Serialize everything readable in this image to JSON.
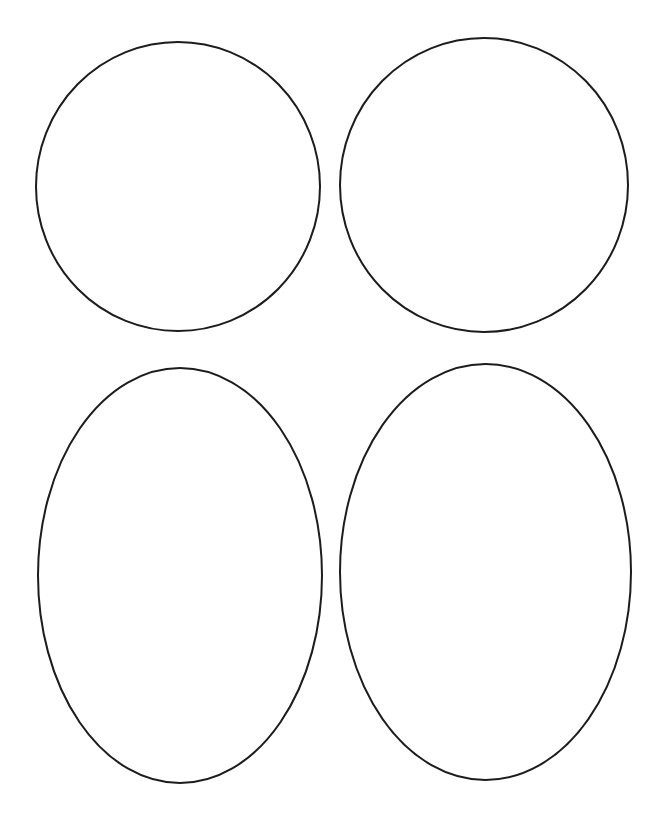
{
  "page": {
    "background_color": "#ffffff",
    "width": 667,
    "height": 825
  },
  "style": {
    "stroke_color": "#1c1c1c",
    "fill_color": "#ffffff",
    "stroke_width": 2
  },
  "shapes": [
    {
      "id": "shape-top-left",
      "name": "circle-top-left",
      "kind": "circle",
      "cx": 178,
      "cy": 186.5,
      "rx": 142,
      "ry": 144.5,
      "bounds": {
        "left": 36,
        "top": 42,
        "right": 320,
        "bottom": 331
      }
    },
    {
      "id": "shape-top-right",
      "name": "circle-top-right",
      "kind": "circle",
      "cx": 484,
      "cy": 185,
      "rx": 144,
      "ry": 147,
      "bounds": {
        "left": 340,
        "top": 38,
        "right": 628,
        "bottom": 332
      }
    },
    {
      "id": "shape-bottom-left",
      "name": "oval-bottom-left",
      "kind": "ellipse",
      "cx": 180,
      "cy": 575.5,
      "rx": 142,
      "ry": 207.5,
      "bounds": {
        "left": 38,
        "top": 368,
        "right": 322,
        "bottom": 783
      }
    },
    {
      "id": "shape-bottom-right",
      "name": "oval-bottom-right",
      "kind": "ellipse",
      "cx": 485.5,
      "cy": 572,
      "rx": 145.5,
      "ry": 208,
      "bounds": {
        "left": 340,
        "top": 364,
        "right": 631,
        "bottom": 780
      }
    }
  ]
}
